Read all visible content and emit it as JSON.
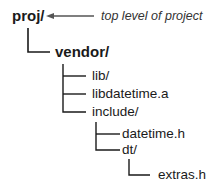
{
  "tree": {
    "root": {
      "label": "proj/"
    },
    "annotation": "top level of project",
    "nodes": [
      {
        "label": "vendor/",
        "depth": 1
      },
      {
        "label": "lib/",
        "depth": 2
      },
      {
        "label": "libdatetime.a",
        "depth": 2
      },
      {
        "label": "include/",
        "depth": 2
      },
      {
        "label": "datetime.h",
        "depth": 3
      },
      {
        "label": "dt/",
        "depth": 3
      },
      {
        "label": "extras.h",
        "depth": 4
      }
    ]
  },
  "colors": {
    "line": "#1a1a1a",
    "arrow": "#555555",
    "text": "#1a1a1a"
  }
}
